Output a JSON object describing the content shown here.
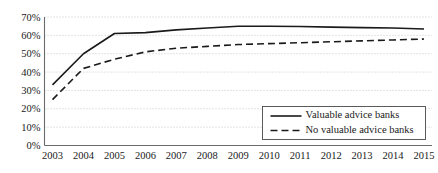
{
  "chart_data": {
    "type": "line",
    "title": "",
    "subtitle": "",
    "xlabel": "",
    "ylabel": "",
    "x": [
      2003,
      2004,
      2005,
      2006,
      2007,
      2008,
      2009,
      2010,
      2011,
      2012,
      2013,
      2014,
      2015
    ],
    "categories": [
      "2003",
      "2004",
      "2005",
      "2006",
      "2007",
      "2008",
      "2009",
      "2010",
      "2011",
      "2012",
      "2013",
      "2014",
      "2015"
    ],
    "series": [
      {
        "name": "Valuable advice banks",
        "style": "solid",
        "color": "#1a1a1a",
        "values": [
          33,
          50,
          61,
          61.5,
          63,
          64,
          65,
          65,
          64.8,
          64.5,
          64.2,
          64,
          63.5
        ]
      },
      {
        "name": "No valuable advice banks",
        "style": "dashed",
        "color": "#1a1a1a",
        "values": [
          25,
          42,
          47,
          51,
          53,
          54,
          55,
          55.5,
          56,
          56.5,
          57,
          57.5,
          58
        ]
      }
    ],
    "ylim": [
      0,
      70
    ],
    "xlim": [
      2003,
      2015
    ],
    "y_ticks": [
      0,
      10,
      20,
      30,
      40,
      50,
      60,
      70
    ],
    "y_tick_labels": [
      "0%",
      "10%",
      "20%",
      "30%",
      "40%",
      "50%",
      "60%",
      "70%"
    ],
    "x_tick_labels": [
      "2003",
      "2004",
      "2005",
      "2006",
      "2007",
      "2008",
      "2009",
      "2010",
      "2011",
      "2012",
      "2013",
      "2014",
      "2015"
    ],
    "grid": {
      "horizontal": true,
      "vertical": false,
      "style": "dotted",
      "color": "#b9b9b9"
    },
    "legend": {
      "position": "bottom-right",
      "border": true,
      "entries": [
        {
          "label": "Valuable advice banks",
          "style": "solid"
        },
        {
          "label": "No valuable advice banks",
          "style": "dashed"
        }
      ]
    },
    "axes": {
      "axis_color": "#6b6b6b",
      "background": "#ffffff"
    }
  }
}
